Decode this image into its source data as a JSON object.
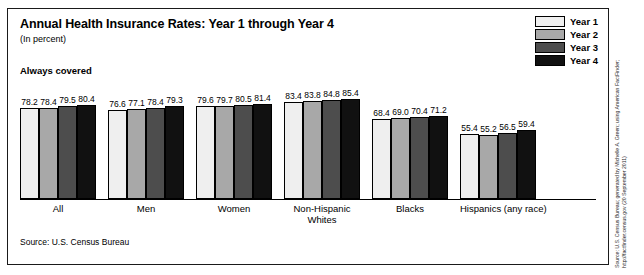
{
  "chart_data": {
    "type": "bar",
    "title": "Annual Health Insurance Rates: Year 1 through Year 4",
    "subtitle": "(In percent)",
    "section_label": "Always covered",
    "xlabel": "",
    "ylabel": "",
    "ylim": [
      0,
      100
    ],
    "grid": false,
    "legend_position": "top-right",
    "categories": [
      "All",
      "Men",
      "Women",
      "Non-Hispanic Whites",
      "Blacks",
      "Hispanics (any race)"
    ],
    "category_lines": [
      [
        "All"
      ],
      [
        "Men"
      ],
      [
        "Women"
      ],
      [
        "Non-Hispanic",
        "Whites"
      ],
      [
        "Blacks"
      ],
      [
        "Hispanics (any race)"
      ]
    ],
    "series": [
      {
        "name": "Year 1",
        "color": "#efefef",
        "values": [
          78.2,
          76.6,
          79.6,
          83.4,
          68.4,
          55.4
        ]
      },
      {
        "name": "Year 2",
        "color": "#a8a8a8",
        "values": [
          78.4,
          77.1,
          79.7,
          83.8,
          69.0,
          55.2
        ]
      },
      {
        "name": "Year 3",
        "color": "#4d4d4d",
        "values": [
          79.5,
          78.4,
          80.5,
          84.8,
          70.4,
          56.5
        ]
      },
      {
        "name": "Year 4",
        "color": "#111111",
        "values": [
          80.4,
          79.3,
          81.4,
          85.4,
          71.2,
          59.4
        ]
      }
    ],
    "source_note": "Source: U.S. Census Bureau"
  },
  "side_credit": "Source: U.S. Census Bureau; generated by Michelle A. Green; using American FactFinder;\nhttp://factfinder.census.gov (20 September 2011)"
}
